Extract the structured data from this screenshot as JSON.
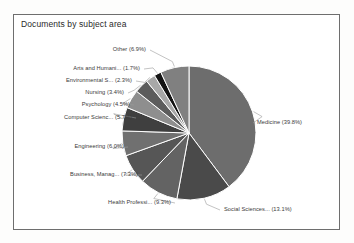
{
  "chart_title": "Documents by subject area",
  "chart_data": {
    "type": "pie",
    "title": "Documents by subject area",
    "xlabel": "",
    "ylabel": "",
    "legend": "none",
    "grid": false,
    "labels_show_percent": true,
    "categories": [
      "Medicine",
      "Social Sciences...",
      "Health Professi...",
      "Business, Manag...",
      "Engineering",
      "Computer Scienc...",
      "Psychology",
      "Nursing",
      "Environmental S...",
      "Arts and Humani...",
      "Other"
    ],
    "values": [
      39.8,
      13.1,
      9.3,
      7.3,
      6.0,
      5.7,
      4.5,
      3.4,
      2.3,
      1.7,
      6.9
    ],
    "slice_labels": [
      "Medicine (39.8%)",
      "Social Sciences... (13.1%)",
      "Health Professi... (9.3%)",
      "Business, Manag... (7.3%)",
      "Engineering (6.0%)",
      "Computer Scienc... (5.7%)",
      "Psychology (4.5%)",
      "Nursing (3.4%)",
      "Environmental S... (2.3%)",
      "Arts and Humani... (1.7%)",
      "Other (6.9%)"
    ],
    "colors": [
      "#6d6d6d",
      "#4a4a4a",
      "#636363",
      "#565656",
      "#707070",
      "#3f3f3f",
      "#8e8e8e",
      "#5c5c5c",
      "#a8a8a8",
      "#141414",
      "#808080"
    ]
  },
  "card": {
    "border_color": "#6e6e6e",
    "background": "#ffffff"
  }
}
